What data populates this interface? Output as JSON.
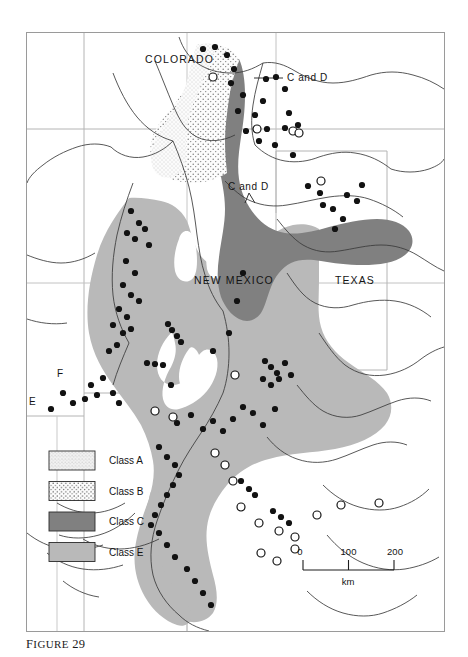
{
  "figure": {
    "caption_prefix": "F",
    "caption_word": "IGURE",
    "caption_number": "29"
  },
  "map": {
    "state_labels": [
      {
        "name": "colorado",
        "text": "COLORADO",
        "x": 118,
        "y": 30
      },
      {
        "name": "new-mexico",
        "text": "NEW MEXICO",
        "x": 167,
        "y": 251
      },
      {
        "name": "texas",
        "text": "TEXAS",
        "x": 308,
        "y": 251
      }
    ],
    "annotations": [
      {
        "name": "c-and-d-north",
        "text": "C and D",
        "x": 260,
        "y": 47
      },
      {
        "name": "c-and-d-central",
        "text": "C and D",
        "x": 224,
        "y": 158
      }
    ],
    "point_labels": [
      {
        "name": "label-e",
        "text": "E",
        "x": 2,
        "y": 372
      },
      {
        "name": "label-f",
        "text": "F",
        "x": 30,
        "y": 344
      }
    ]
  },
  "legend": {
    "items": [
      {
        "key": "class-a",
        "label": "Class A",
        "fill": "#ededed",
        "pattern": "fine-stipple"
      },
      {
        "key": "class-b",
        "label": "Class B",
        "fill": "#f4f4f4",
        "pattern": "coarse-stipple"
      },
      {
        "key": "class-c",
        "label": "Class C",
        "fill": "#808080",
        "pattern": "solid"
      },
      {
        "key": "class-e",
        "label": "Class E",
        "fill": "#b9b9b9",
        "pattern": "solid"
      }
    ]
  },
  "scale_bar": {
    "ticks": [
      "0",
      "100",
      "200"
    ],
    "unit": "km"
  },
  "colors": {
    "class_c": "#808080",
    "class_e": "#b9b9b9",
    "stipple_bg": "#fbfbfb",
    "frame": "#9a9a9a",
    "grid": "#b0b0b0",
    "river": "#3c3c3c",
    "site_filled": "#121212",
    "site_hollow": "#ffffff"
  },
  "sites": {
    "filled": [
      [
        176,
        16
      ],
      [
        188,
        14
      ],
      [
        200,
        22
      ],
      [
        207,
        36
      ],
      [
        204,
        50
      ],
      [
        216,
        62
      ],
      [
        211,
        78
      ],
      [
        228,
        82
      ],
      [
        236,
        68
      ],
      [
        239,
        46
      ],
      [
        249,
        44
      ],
      [
        258,
        56
      ],
      [
        262,
        80
      ],
      [
        271,
        92
      ],
      [
        258,
        95
      ],
      [
        240,
        96
      ],
      [
        219,
        98
      ],
      [
        232,
        108
      ],
      [
        248,
        112
      ],
      [
        266,
        122
      ],
      [
        281,
        153
      ],
      [
        293,
        160
      ],
      [
        296,
        172
      ],
      [
        306,
        176
      ],
      [
        320,
        162
      ],
      [
        335,
        152
      ],
      [
        330,
        168
      ],
      [
        316,
        186
      ],
      [
        308,
        196
      ],
      [
        104,
        178
      ],
      [
        112,
        190
      ],
      [
        100,
        200
      ],
      [
        108,
        206
      ],
      [
        118,
        196
      ],
      [
        122,
        212
      ],
      [
        99,
        228
      ],
      [
        108,
        240
      ],
      [
        96,
        252
      ],
      [
        104,
        262
      ],
      [
        112,
        268
      ],
      [
        92,
        276
      ],
      [
        100,
        284
      ],
      [
        86,
        292
      ],
      [
        96,
        300
      ],
      [
        104,
        296
      ],
      [
        90,
        312
      ],
      [
        82,
        318
      ],
      [
        141,
        291
      ],
      [
        145,
        297
      ],
      [
        150,
        303
      ],
      [
        154,
        309
      ],
      [
        120,
        330
      ],
      [
        128,
        331
      ],
      [
        136,
        332
      ],
      [
        76,
        345
      ],
      [
        64,
        352
      ],
      [
        70,
        362
      ],
      [
        58,
        366
      ],
      [
        46,
        370
      ],
      [
        24,
        376
      ],
      [
        36,
        360
      ],
      [
        86,
        360
      ],
      [
        92,
        370
      ],
      [
        144,
        352
      ],
      [
        186,
        318
      ],
      [
        202,
        300
      ],
      [
        210,
        268
      ],
      [
        216,
        240
      ],
      [
        238,
        328
      ],
      [
        244,
        334
      ],
      [
        250,
        340
      ],
      [
        252,
        346
      ],
      [
        244,
        352
      ],
      [
        236,
        346
      ],
      [
        258,
        330
      ],
      [
        264,
        342
      ],
      [
        150,
        390
      ],
      [
        164,
        382
      ],
      [
        176,
        396
      ],
      [
        186,
        388
      ],
      [
        196,
        398
      ],
      [
        206,
        386
      ],
      [
        216,
        374
      ],
      [
        226,
        380
      ],
      [
        236,
        392
      ],
      [
        248,
        376
      ],
      [
        132,
        414
      ],
      [
        140,
        424
      ],
      [
        148,
        432
      ],
      [
        152,
        442
      ],
      [
        146,
        452
      ],
      [
        140,
        462
      ],
      [
        134,
        472
      ],
      [
        128,
        482
      ],
      [
        124,
        492
      ],
      [
        132,
        500
      ],
      [
        140,
        512
      ],
      [
        148,
        524
      ],
      [
        160,
        536
      ],
      [
        168,
        548
      ],
      [
        176,
        560
      ],
      [
        184,
        572
      ],
      [
        214,
        448
      ],
      [
        222,
        456
      ],
      [
        228,
        462
      ],
      [
        246,
        478
      ],
      [
        254,
        484
      ],
      [
        262,
        490
      ]
    ],
    "hollow": [
      [
        186,
        44
      ],
      [
        230,
        96
      ],
      [
        266,
        98
      ],
      [
        272,
        100
      ],
      [
        294,
        148
      ],
      [
        208,
        342
      ],
      [
        128,
        378
      ],
      [
        146,
        384
      ],
      [
        188,
        420
      ],
      [
        198,
        432
      ],
      [
        206,
        448
      ],
      [
        214,
        474
      ],
      [
        232,
        490
      ],
      [
        252,
        498
      ],
      [
        268,
        504
      ],
      [
        290,
        482
      ],
      [
        314,
        472
      ],
      [
        352,
        470
      ],
      [
        234,
        520
      ],
      [
        250,
        528
      ],
      [
        268,
        516
      ]
    ]
  }
}
